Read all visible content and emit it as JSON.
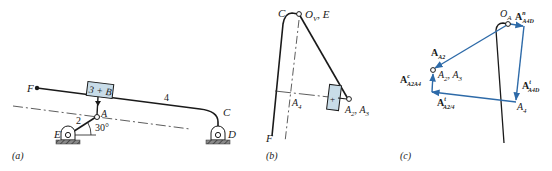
{
  "figure": {
    "panels": [
      {
        "id": "a",
        "caption": "(a)",
        "labels": {
          "F": "F",
          "block": "3 + B",
          "link4": "4",
          "C": "C",
          "D": "D",
          "A": "A",
          "link2": "2",
          "E": "E",
          "angle": "30°"
        }
      },
      {
        "id": "b",
        "caption": "(b)",
        "labels": {
          "C": "C",
          "O": "O",
          "O_sub": "V",
          "O_suffix": ", E",
          "A4": "A",
          "A4_sub": "4",
          "A23_a": "A",
          "A23_a_sub": "2",
          "A23_sep": ", ",
          "A23_b": "A",
          "A23_b_sub": "3",
          "F": "F",
          "block_mark": "+"
        }
      },
      {
        "id": "c",
        "caption": "(c)",
        "labels": {
          "OA": "O",
          "OA_sub": "A",
          "AnA4D": "A",
          "AnA4D_sup": "n",
          "AnA4D_sub": "A4D",
          "AA2": "A",
          "AA2_sub": "A2",
          "A23_a": "A",
          "A23_a_sub": "2",
          "A23_b": "A",
          "A23_b_sub": "3",
          "AcA2A4": "A",
          "AcA2A4_sup": "c",
          "AcA2A4_sub": "A2A4",
          "AtA4D": "A",
          "AtA4D_sup": "t",
          "AtA4D_sub": "A4D",
          "AtA24": "A",
          "AtA24_sup": "t",
          "AtA24_sub": "A2/4",
          "A4": "A",
          "A4_sub": "4"
        }
      }
    ],
    "colors": {
      "line": "#1a1a1a",
      "vector": "#2d6aa8",
      "block_fill": "#c8dce8",
      "ground": "#555555"
    }
  }
}
